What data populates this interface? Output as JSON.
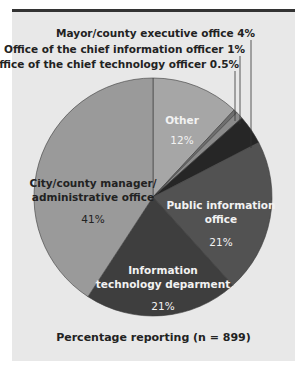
{
  "chart_data": {
    "type": "pie",
    "title": "",
    "caption": "Percentage reporting (n = 899)",
    "start_angle_deg": 0,
    "direction": "clockwise",
    "slices": [
      {
        "label": "Other",
        "value": 12,
        "display": "12%",
        "color": "#a6a6a6"
      },
      {
        "label": "Office of the chief technology officer",
        "value": 0.5,
        "display": "0.5%",
        "color": "#6e6e6e"
      },
      {
        "label": "Office of the chief information officer",
        "value": 1,
        "display": "1%",
        "color": "#8a8a8a"
      },
      {
        "label": "Mayor/county executive office",
        "value": 4,
        "display": "4%",
        "color": "#262626"
      },
      {
        "label": "Public information office",
        "value": 21,
        "display": "21%",
        "color": "#525252"
      },
      {
        "label": "Information technology deparment",
        "value": 21,
        "display": "21%",
        "color": "#3e3e3e"
      },
      {
        "label": "City/county manager/ administrative office",
        "value": 41,
        "display": "41%",
        "color": "#9a9a9a"
      }
    ]
  },
  "labels": {
    "mayor": "Mayor/county executive office  4%",
    "cio": "Office of the chief information officer  1%",
    "cto": "Office of the chief technology officer  0.5%",
    "other_name": "Other",
    "other_pct": "12%",
    "city_line1": "City/county manager/",
    "city_line2": "administrative office",
    "city_pct": "41%",
    "pio_line1": "Public information",
    "pio_line2": "office",
    "pio_pct": "21%",
    "it_line1": "Information",
    "it_line2": "technology deparment",
    "it_pct": "21%"
  }
}
